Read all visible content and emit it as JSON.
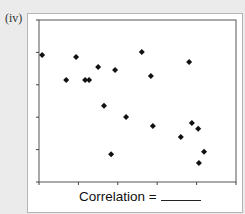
{
  "panel": {
    "label": "(iv)"
  },
  "caption": {
    "text": "Correlation =",
    "blank": "______"
  },
  "colors": {
    "background": "#ebebeb",
    "panel": "#ffffff",
    "axis": "#444444",
    "marker": "#111111"
  },
  "chart_data": {
    "type": "scatter",
    "title": "",
    "xlabel": "",
    "ylabel": "",
    "xlim": [
      0,
      5
    ],
    "ylim": [
      0,
      5
    ],
    "x_ticks": [
      0,
      1,
      2,
      3,
      4,
      5
    ],
    "y_ticks": [
      0,
      1,
      2,
      3,
      4,
      5
    ],
    "tick_labels_shown": false,
    "grid": false,
    "legend": null,
    "marker": "diamond",
    "annotation": "Correlation = ______",
    "points": [
      {
        "x": 0.08,
        "y": 3.92
      },
      {
        "x": 0.69,
        "y": 3.15
      },
      {
        "x": 0.94,
        "y": 3.86
      },
      {
        "x": 1.17,
        "y": 3.15
      },
      {
        "x": 1.27,
        "y": 3.15
      },
      {
        "x": 1.5,
        "y": 3.55
      },
      {
        "x": 1.65,
        "y": 2.35
      },
      {
        "x": 1.83,
        "y": 0.86
      },
      {
        "x": 1.93,
        "y": 3.46
      },
      {
        "x": 2.21,
        "y": 2.01
      },
      {
        "x": 2.61,
        "y": 4.01
      },
      {
        "x": 2.84,
        "y": 3.27
      },
      {
        "x": 2.89,
        "y": 1.73
      },
      {
        "x": 3.6,
        "y": 1.39
      },
      {
        "x": 3.81,
        "y": 3.7
      },
      {
        "x": 3.88,
        "y": 1.82
      },
      {
        "x": 4.04,
        "y": 1.64
      },
      {
        "x": 4.06,
        "y": 0.59
      },
      {
        "x": 4.19,
        "y": 0.93
      }
    ]
  }
}
